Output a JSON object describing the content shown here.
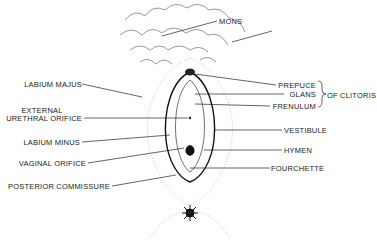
{
  "diagram": {
    "title": "",
    "labels_left": [
      {
        "id": "labium-majus",
        "text": "LABIUM MAJUS"
      },
      {
        "id": "external-urethral-orifice-1",
        "text": "EXTERNAL"
      },
      {
        "id": "external-urethral-orifice-2",
        "text": "URETHRAL ORIFICE"
      },
      {
        "id": "labium-minus",
        "text": "LABIUM MINUS"
      },
      {
        "id": "vaginal-orifice",
        "text": "VAGINAL ORIFICE"
      },
      {
        "id": "posterior-commissure",
        "text": "POSTERIOR COMMISSURE"
      }
    ],
    "labels_right": [
      {
        "id": "mons",
        "text": "MONS"
      },
      {
        "id": "prepuce",
        "text": "PREPUCE"
      },
      {
        "id": "glans",
        "text": "GLANS"
      },
      {
        "id": "frenulum",
        "text": "FRENULUM"
      },
      {
        "id": "of-clitoris",
        "text": "OF CLITORIS"
      },
      {
        "id": "vestibule",
        "text": "VESTIBULE"
      },
      {
        "id": "hymen",
        "text": "HYMEN"
      },
      {
        "id": "fourchette",
        "text": "FOURCHETTE"
      }
    ]
  }
}
